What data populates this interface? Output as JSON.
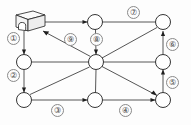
{
  "diagram": {
    "canvas": {
      "width": 191,
      "height": 125
    },
    "depot": {
      "icon_name": "depot-box-icon",
      "x": 30,
      "y": 23
    },
    "nodes": [
      {
        "id": "n-top-center",
        "x": 95,
        "y": 22,
        "r": 7.5
      },
      {
        "id": "n-top-right",
        "x": 163,
        "y": 22,
        "r": 7.5
      },
      {
        "id": "n-left-mid",
        "x": 24,
        "y": 62,
        "r": 7.5
      },
      {
        "id": "n-center",
        "x": 96,
        "y": 62,
        "r": 7.5
      },
      {
        "id": "n-right-mid",
        "x": 163,
        "y": 62,
        "r": 7.5
      },
      {
        "id": "n-bottom-left",
        "x": 24,
        "y": 100,
        "r": 7.5
      },
      {
        "id": "n-bottom-center",
        "x": 95,
        "y": 100,
        "r": 7.5
      },
      {
        "id": "n-bottom-right",
        "x": 163,
        "y": 100,
        "r": 7.5
      }
    ],
    "edges": [
      {
        "id": "e1",
        "from": "depot",
        "to": "n-left-mid",
        "label": "①",
        "label_x": 13,
        "label_y": 38,
        "kind": "vertical"
      },
      {
        "id": "e2",
        "from": "n-left-mid",
        "to": "n-bottom-left",
        "label": "②",
        "label_x": 13,
        "label_y": 75,
        "kind": "vertical"
      },
      {
        "id": "e3",
        "from": "n-bottom-left",
        "to": "n-bottom-center",
        "label": "③",
        "label_x": 52,
        "label_y": 104,
        "kind": "horizontal"
      },
      {
        "id": "e4",
        "from": "n-bottom-center",
        "to": "n-bottom-right",
        "label": "④",
        "label_x": 120,
        "label_y": 104,
        "kind": "horizontal"
      },
      {
        "id": "e5",
        "from": "n-bottom-right",
        "to": "n-right-mid",
        "label": "⑤",
        "label_x": 166,
        "label_y": 78,
        "kind": "vertical"
      },
      {
        "id": "e6",
        "from": "n-right-mid",
        "to": "n-top-right",
        "label": "⑥",
        "label_x": 166,
        "label_y": 38,
        "kind": "vertical"
      },
      {
        "id": "e7",
        "from": "n-top-right",
        "to": "n-top-center",
        "label": "⑦",
        "label_x": 128,
        "label_y": 8,
        "kind": "horizontal"
      },
      {
        "id": "e8",
        "from": "n-top-center",
        "to": "n-center",
        "label": "⑧",
        "label_x": 90,
        "label_y": 35,
        "kind": "vertical"
      },
      {
        "id": "e9",
        "from": "n-center",
        "to": "depot",
        "label": "⑨",
        "label_x": 64,
        "label_y": 35,
        "kind": "diagonal"
      }
    ],
    "unlabeled_edges": [
      {
        "id": "u1",
        "from": "depot",
        "to": "n-top-center",
        "kind": "horizontal"
      },
      {
        "id": "u2",
        "from": "n-left-mid",
        "to": "n-center",
        "kind": "horizontal"
      },
      {
        "id": "u3",
        "from": "n-center",
        "to": "n-right-mid",
        "kind": "horizontal"
      },
      {
        "id": "u4",
        "from": "n-bottom-center",
        "to": "n-center",
        "kind": "vertical"
      },
      {
        "id": "u5",
        "from": "n-bottom-left",
        "to": "n-center",
        "kind": "diagonal"
      },
      {
        "id": "u6",
        "from": "n-top-right",
        "to": "n-center",
        "kind": "diagonal"
      },
      {
        "id": "u7",
        "from": "n-center",
        "to": "n-bottom-right",
        "kind": "diagonal"
      }
    ],
    "colors": {
      "line": "#2b2b2b",
      "node_fill": "#ffffff",
      "node_stroke": "#1f1f1f",
      "label_text": "#444444",
      "label_border": "#8a8a8a",
      "background": "#fdfdfd"
    }
  }
}
